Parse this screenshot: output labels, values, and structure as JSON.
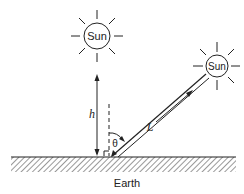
{
  "diagram": {
    "suns": [
      {
        "id": "overhead",
        "label": "Sun",
        "cx": 97,
        "cy": 36,
        "r": 13
      },
      {
        "id": "inclined",
        "label": "Sun",
        "cx": 217,
        "cy": 66,
        "r": 11
      }
    ],
    "labels": {
      "height": "h",
      "path_length": "L",
      "angle": "θ",
      "ground": "Earth"
    },
    "colors": {
      "stroke": "#222222",
      "background": "#ffffff"
    }
  }
}
